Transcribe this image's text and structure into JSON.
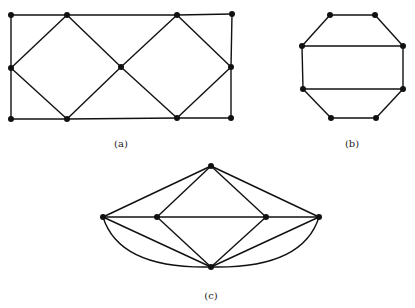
{
  "graphs": [
    {
      "id": "a",
      "label": "(a)",
      "vertices": [
        "a1",
        "a2",
        "a3",
        "a4",
        "a5",
        "a6",
        "a7",
        "a8",
        "a9",
        "a10",
        "a11"
      ],
      "edges": [
        [
          "a1",
          "a2"
        ],
        [
          "a2",
          "a3"
        ],
        [
          "a3",
          "a4"
        ],
        [
          "a1",
          "a5"
        ],
        [
          "a5",
          "a6"
        ],
        [
          "a4",
          "a7"
        ],
        [
          "a7",
          "a11"
        ],
        [
          "a6",
          "a8"
        ],
        [
          "a8",
          "a9"
        ],
        [
          "a9",
          "a11"
        ],
        [
          "a5",
          "a2"
        ],
        [
          "a2",
          "a10"
        ],
        [
          "a5",
          "a8"
        ],
        [
          "a8",
          "a10"
        ],
        [
          "a10",
          "a3"
        ],
        [
          "a3",
          "a7"
        ],
        [
          "a10",
          "a9"
        ],
        [
          "a9",
          "a7"
        ]
      ]
    },
    {
      "id": "b",
      "label": "(b)",
      "vertices": [
        "b1",
        "b2",
        "b3",
        "b4",
        "b5",
        "b6",
        "b7",
        "b8"
      ],
      "edges": [
        [
          "b1",
          "b2"
        ],
        [
          "b2",
          "b4"
        ],
        [
          "b4",
          "b6"
        ],
        [
          "b6",
          "b8"
        ],
        [
          "b8",
          "b7"
        ],
        [
          "b7",
          "b5"
        ],
        [
          "b5",
          "b3"
        ],
        [
          "b3",
          "b1"
        ],
        [
          "b3",
          "b4"
        ],
        [
          "b5",
          "b6"
        ]
      ]
    },
    {
      "id": "c",
      "label": "(c)",
      "vertices": [
        "c1",
        "c2",
        "c3",
        "c4",
        "c5",
        "c6"
      ],
      "edges": [
        [
          "c1",
          "c2"
        ],
        [
          "c1",
          "c3"
        ],
        [
          "c1",
          "c4"
        ],
        [
          "c1",
          "c5"
        ],
        [
          "c2",
          "c3"
        ],
        [
          "c3",
          "c4"
        ],
        [
          "c4",
          "c5"
        ],
        [
          "c2",
          "c6"
        ],
        [
          "c3",
          "c6"
        ],
        [
          "c4",
          "c6"
        ],
        [
          "c5",
          "c6"
        ]
      ],
      "curved_edges": [
        [
          "c2",
          "c6"
        ],
        [
          "c5",
          "c6"
        ]
      ]
    }
  ],
  "colors": {
    "stroke": "#111111",
    "vertex": "#111111",
    "background": "#ffffff"
  }
}
